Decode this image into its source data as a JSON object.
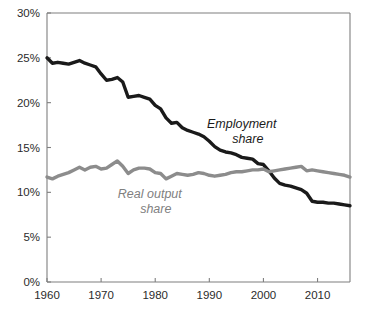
{
  "chart_data": {
    "type": "line",
    "title": "",
    "subtitle": "",
    "xlabel": "",
    "ylabel": "",
    "xlim": [
      1960,
      2016
    ],
    "ylim": [
      0,
      30
    ],
    "grid": false,
    "legend_position": "inline-annotations",
    "y_tick_labels": [
      "30%",
      "25%",
      "20%",
      "15%",
      "10%",
      "5%",
      "0%"
    ],
    "y_tick_values": [
      30,
      25,
      20,
      15,
      10,
      5,
      0
    ],
    "x_tick_labels": [
      "1960",
      "1970",
      "1980",
      "1990",
      "2000",
      "2010"
    ],
    "x_tick_values": [
      1960,
      1970,
      1980,
      1990,
      2000,
      2010
    ],
    "annotations": [
      {
        "name": "employment-share-label",
        "text_line1": "Employment",
        "text_line2": "share",
        "color": "#1a1a1a",
        "x": 1996,
        "y": 17.2
      },
      {
        "name": "real-output-share-label",
        "text_line1": "Real output",
        "text_line2": "share",
        "color": "#808080",
        "x": 1979,
        "y": 9.4
      }
    ],
    "x": [
      1960,
      1961,
      1962,
      1963,
      1964,
      1965,
      1966,
      1967,
      1968,
      1969,
      1970,
      1971,
      1972,
      1973,
      1974,
      1975,
      1976,
      1977,
      1978,
      1979,
      1980,
      1981,
      1982,
      1983,
      1984,
      1985,
      1986,
      1987,
      1988,
      1989,
      1990,
      1991,
      1992,
      1993,
      1994,
      1995,
      1996,
      1997,
      1998,
      1999,
      2000,
      2001,
      2002,
      2003,
      2004,
      2005,
      2006,
      2007,
      2008,
      2009,
      2010,
      2011,
      2012,
      2013,
      2014,
      2015,
      2016
    ],
    "series": [
      {
        "name": "Employment share",
        "color": "#1a1a1a",
        "line_width": 3.4,
        "values": [
          25.0,
          24.4,
          24.5,
          24.4,
          24.3,
          24.5,
          24.7,
          24.4,
          24.2,
          24.0,
          23.2,
          22.5,
          22.6,
          22.8,
          22.3,
          20.6,
          20.7,
          20.8,
          20.6,
          20.4,
          19.7,
          19.3,
          18.3,
          17.7,
          17.8,
          17.2,
          16.9,
          16.7,
          16.5,
          16.2,
          15.7,
          15.1,
          14.7,
          14.5,
          14.4,
          14.2,
          13.9,
          13.8,
          13.7,
          13.2,
          13.1,
          12.4,
          11.6,
          11.0,
          10.8,
          10.7,
          10.5,
          10.3,
          9.9,
          9.0,
          8.9,
          8.9,
          8.8,
          8.8,
          8.7,
          8.6,
          8.5
        ]
      },
      {
        "name": "Real output share",
        "color": "#8c8c8c",
        "line_width": 3.4,
        "values": [
          11.7,
          11.5,
          11.8,
          12.0,
          12.2,
          12.5,
          12.8,
          12.5,
          12.8,
          12.9,
          12.6,
          12.7,
          13.1,
          13.5,
          12.9,
          12.1,
          12.5,
          12.7,
          12.7,
          12.6,
          12.2,
          12.1,
          11.5,
          11.8,
          12.1,
          12.0,
          11.9,
          12.0,
          12.2,
          12.1,
          11.9,
          11.8,
          11.9,
          12.0,
          12.2,
          12.3,
          12.3,
          12.4,
          12.5,
          12.5,
          12.6,
          12.3,
          12.4,
          12.5,
          12.6,
          12.7,
          12.8,
          12.9,
          12.4,
          12.5,
          12.4,
          12.3,
          12.2,
          12.1,
          12.0,
          11.9,
          11.7
        ]
      }
    ]
  },
  "chart_meta": {
    "plot_left": 47,
    "plot_right": 350,
    "plot_top": 13,
    "plot_bottom": 282
  }
}
